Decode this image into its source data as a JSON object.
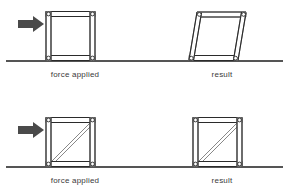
{
  "figure": {
    "background_color": "#ffffff",
    "width": 289,
    "height": 195
  },
  "colors": {
    "arrow": "#4a4a4a",
    "member_outline": "#2b2b2b",
    "member_inner": "#6d6d6d",
    "brace": "#7b7b7b",
    "ground": "#1d1d1d",
    "joint_fill": "#ffffff",
    "caption_text": "#3a3a3a"
  },
  "panels": [
    {
      "id": "top-left",
      "caption": "force applied",
      "caption_x": 75,
      "caption_y": 70,
      "shape": "square",
      "braced": false,
      "has_arrow": true,
      "arrow_direction": "right"
    },
    {
      "id": "top-right",
      "caption": "result",
      "caption_x": 222,
      "caption_y": 70,
      "shape": "parallelogram",
      "braced": false,
      "has_arrow": false,
      "arrow_direction": ""
    },
    {
      "id": "bottom-left",
      "caption": "force applied",
      "caption_x": 75,
      "caption_y": 176,
      "shape": "square",
      "braced": true,
      "has_arrow": true,
      "arrow_direction": "right"
    },
    {
      "id": "bottom-right",
      "caption": "result",
      "caption_x": 222,
      "caption_y": 176,
      "shape": "square",
      "braced": true,
      "has_arrow": false,
      "arrow_direction": ""
    }
  ],
  "icons": {
    "force_arrow": "arrow-right-icon",
    "pin_joint": "pin-joint-icon",
    "ground_line": "ground-line-icon",
    "diagonal_brace": "diagonal-brace-icon"
  }
}
